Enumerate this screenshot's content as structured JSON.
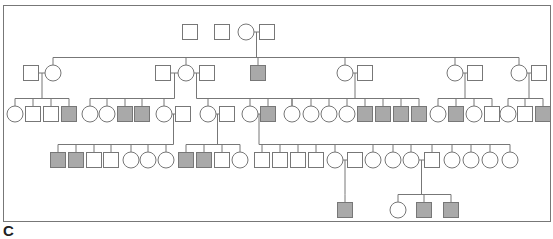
{
  "figure": {
    "panel_label": "C",
    "type": "pedigree",
    "colors": {
      "line": "#777777",
      "affected_fill": "#a9a9a9",
      "unaffected_fill": "#ffffff"
    },
    "legend": {
      "square": "male",
      "circle": "female",
      "shaded": "affected",
      "open": "unaffected"
    }
  },
  "individuals": [
    {
      "id": "I-1",
      "gen": 1,
      "sex": "M",
      "affected": false
    },
    {
      "id": "I-2",
      "gen": 1,
      "sex": "M",
      "affected": false
    },
    {
      "id": "I-3",
      "gen": 1,
      "sex": "F",
      "affected": false
    },
    {
      "id": "I-4",
      "gen": 1,
      "sex": "M",
      "affected": false
    },
    {
      "id": "II-1",
      "gen": 2,
      "sex": "M",
      "affected": false
    },
    {
      "id": "II-2",
      "gen": 2,
      "sex": "F",
      "affected": false
    },
    {
      "id": "II-3",
      "gen": 2,
      "sex": "M",
      "affected": false
    },
    {
      "id": "II-4",
      "gen": 2,
      "sex": "F",
      "affected": false
    },
    {
      "id": "II-5",
      "gen": 2,
      "sex": "M",
      "affected": false
    },
    {
      "id": "II-6",
      "gen": 2,
      "sex": "M",
      "affected": true
    },
    {
      "id": "II-7",
      "gen": 2,
      "sex": "F",
      "affected": false
    },
    {
      "id": "II-8",
      "gen": 2,
      "sex": "M",
      "affected": false
    },
    {
      "id": "II-9",
      "gen": 2,
      "sex": "F",
      "affected": false
    },
    {
      "id": "II-10",
      "gen": 2,
      "sex": "M",
      "affected": false
    },
    {
      "id": "II-11",
      "gen": 2,
      "sex": "F",
      "affected": false
    },
    {
      "id": "II-12",
      "gen": 2,
      "sex": "M",
      "affected": false
    },
    {
      "id": "III-1",
      "gen": 3,
      "sex": "F",
      "affected": false
    },
    {
      "id": "III-2",
      "gen": 3,
      "sex": "M",
      "affected": false
    },
    {
      "id": "III-3",
      "gen": 3,
      "sex": "M",
      "affected": false
    },
    {
      "id": "III-4",
      "gen": 3,
      "sex": "M",
      "affected": true
    },
    {
      "id": "III-5",
      "gen": 3,
      "sex": "F",
      "affected": false
    },
    {
      "id": "III-6",
      "gen": 3,
      "sex": "F",
      "affected": false
    },
    {
      "id": "III-7",
      "gen": 3,
      "sex": "M",
      "affected": true
    },
    {
      "id": "III-8",
      "gen": 3,
      "sex": "M",
      "affected": true
    },
    {
      "id": "III-9",
      "gen": 3,
      "sex": "F",
      "affected": false
    },
    {
      "id": "III-10",
      "gen": 3,
      "sex": "M",
      "affected": false
    },
    {
      "id": "III-11",
      "gen": 3,
      "sex": "F",
      "affected": false
    },
    {
      "id": "III-12",
      "gen": 3,
      "sex": "M",
      "affected": false
    },
    {
      "id": "III-13",
      "gen": 3,
      "sex": "F",
      "affected": false
    },
    {
      "id": "III-14",
      "gen": 3,
      "sex": "M",
      "affected": true
    },
    {
      "id": "III-15",
      "gen": 3,
      "sex": "F",
      "affected": false
    },
    {
      "id": "III-16",
      "gen": 3,
      "sex": "F",
      "affected": false
    },
    {
      "id": "III-17",
      "gen": 3,
      "sex": "F",
      "affected": false
    },
    {
      "id": "III-18",
      "gen": 3,
      "sex": "F",
      "affected": false
    },
    {
      "id": "III-19",
      "gen": 3,
      "sex": "F",
      "affected": false
    },
    {
      "id": "III-20",
      "gen": 3,
      "sex": "M",
      "affected": true
    },
    {
      "id": "III-21",
      "gen": 3,
      "sex": "M",
      "affected": true
    },
    {
      "id": "III-22",
      "gen": 3,
      "sex": "M",
      "affected": true
    },
    {
      "id": "III-23",
      "gen": 3,
      "sex": "M",
      "affected": true
    },
    {
      "id": "III-24",
      "gen": 3,
      "sex": "F",
      "affected": false
    },
    {
      "id": "III-25",
      "gen": 3,
      "sex": "M",
      "affected": true
    },
    {
      "id": "III-26",
      "gen": 3,
      "sex": "F",
      "affected": false
    },
    {
      "id": "III-27",
      "gen": 3,
      "sex": "M",
      "affected": false
    },
    {
      "id": "III-28",
      "gen": 3,
      "sex": "F",
      "affected": false
    },
    {
      "id": "III-29",
      "gen": 3,
      "sex": "M",
      "affected": false
    },
    {
      "id": "III-30",
      "gen": 3,
      "sex": "M",
      "affected": true
    },
    {
      "id": "IV-1",
      "gen": 4,
      "sex": "M",
      "affected": true
    },
    {
      "id": "IV-2",
      "gen": 4,
      "sex": "M",
      "affected": true
    },
    {
      "id": "IV-3",
      "gen": 4,
      "sex": "M",
      "affected": false
    },
    {
      "id": "IV-4",
      "gen": 4,
      "sex": "M",
      "affected": false
    },
    {
      "id": "IV-5",
      "gen": 4,
      "sex": "F",
      "affected": false
    },
    {
      "id": "IV-6",
      "gen": 4,
      "sex": "F",
      "affected": false
    },
    {
      "id": "IV-7",
      "gen": 4,
      "sex": "F",
      "affected": false
    },
    {
      "id": "IV-8",
      "gen": 4,
      "sex": "M",
      "affected": true
    },
    {
      "id": "IV-9",
      "gen": 4,
      "sex": "M",
      "affected": true
    },
    {
      "id": "IV-10",
      "gen": 4,
      "sex": "M",
      "affected": false
    },
    {
      "id": "IV-11",
      "gen": 4,
      "sex": "F",
      "affected": false
    },
    {
      "id": "IV-12",
      "gen": 4,
      "sex": "M",
      "affected": false
    },
    {
      "id": "IV-13",
      "gen": 4,
      "sex": "M",
      "affected": false
    },
    {
      "id": "IV-14",
      "gen": 4,
      "sex": "M",
      "affected": false
    },
    {
      "id": "IV-15",
      "gen": 4,
      "sex": "M",
      "affected": false
    },
    {
      "id": "IV-16",
      "gen": 4,
      "sex": "F",
      "affected": false
    },
    {
      "id": "IV-17",
      "gen": 4,
      "sex": "M",
      "affected": false
    },
    {
      "id": "IV-18",
      "gen": 4,
      "sex": "F",
      "affected": false
    },
    {
      "id": "IV-19",
      "gen": 4,
      "sex": "F",
      "affected": false
    },
    {
      "id": "IV-20",
      "gen": 4,
      "sex": "F",
      "affected": false
    },
    {
      "id": "IV-21",
      "gen": 4,
      "sex": "M",
      "affected": false
    },
    {
      "id": "IV-22",
      "gen": 4,
      "sex": "F",
      "affected": false
    },
    {
      "id": "IV-23",
      "gen": 4,
      "sex": "F",
      "affected": false
    },
    {
      "id": "IV-24",
      "gen": 4,
      "sex": "F",
      "affected": false
    },
    {
      "id": "IV-25",
      "gen": 4,
      "sex": "F",
      "affected": false
    },
    {
      "id": "V-1",
      "gen": 5,
      "sex": "M",
      "affected": true
    },
    {
      "id": "V-2",
      "gen": 5,
      "sex": "F",
      "affected": false
    },
    {
      "id": "V-3",
      "gen": 5,
      "sex": "M",
      "affected": true
    },
    {
      "id": "V-4",
      "gen": 5,
      "sex": "M",
      "affected": true
    }
  ],
  "matings": [
    {
      "partners": [
        "I-3",
        "I-4"
      ],
      "children": [
        "II-2",
        "II-4",
        "II-6",
        "II-7",
        "II-9",
        "II-11"
      ]
    },
    {
      "partners": [
        "II-1",
        "II-2"
      ],
      "children": [
        "III-1",
        "III-2",
        "III-3",
        "III-4"
      ]
    },
    {
      "partners": [
        "II-3",
        "II-4"
      ],
      "children": [
        "III-5",
        "III-6",
        "III-7",
        "III-8",
        "III-9"
      ]
    },
    {
      "partners": [
        "II-4",
        "II-5"
      ],
      "children": [
        "III-11",
        "III-13",
        "III-14",
        "III-15"
      ]
    },
    {
      "partners": [
        "II-7",
        "II-8"
      ],
      "children": [
        "III-16",
        "III-17",
        "III-18",
        "III-19",
        "III-20",
        "III-21",
        "III-22",
        "III-23"
      ]
    },
    {
      "partners": [
        "II-9",
        "II-10"
      ],
      "children": [
        "III-24",
        "III-25",
        "III-26",
        "III-27"
      ]
    },
    {
      "partners": [
        "II-11",
        "II-12"
      ],
      "children": [
        "III-28",
        "III-29",
        "III-30"
      ]
    },
    {
      "partners": [
        "III-9",
        "III-10"
      ],
      "children": [
        "IV-1",
        "IV-2",
        "IV-3",
        "IV-4",
        "IV-5",
        "IV-6",
        "IV-7"
      ]
    },
    {
      "partners": [
        "III-11",
        "III-12"
      ],
      "children": [
        "IV-8",
        "IV-9",
        "IV-10",
        "IV-11"
      ]
    },
    {
      "partners": [
        "III-13",
        "III-14"
      ],
      "children": [
        "IV-12",
        "IV-13",
        "IV-14",
        "IV-15",
        "IV-16",
        "IV-18",
        "IV-19",
        "IV-20",
        "IV-21",
        "IV-22",
        "IV-23",
        "IV-24",
        "IV-25"
      ]
    },
    {
      "partners": [
        "IV-16",
        "IV-17"
      ],
      "children": [
        "V-1"
      ]
    },
    {
      "partners": [
        "IV-20",
        "IV-21"
      ],
      "children": [
        "V-2",
        "V-3",
        "V-4"
      ]
    }
  ]
}
